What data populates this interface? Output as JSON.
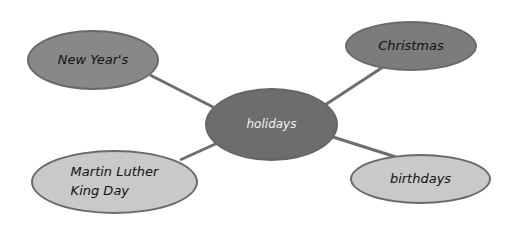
{
  "diagram": {
    "type": "mind-map",
    "center": {
      "label": "holidays",
      "color": "#6d6d6d"
    },
    "branches": [
      {
        "id": "new-years",
        "label": "New Year's",
        "color": "#888888"
      },
      {
        "id": "christmas",
        "label": "Christmas",
        "color": "#7c7c7c"
      },
      {
        "id": "mlk-day",
        "label_line1": "Martin Luther",
        "label_line2": "King Day",
        "color": "#c9c9c9"
      },
      {
        "id": "birthdays",
        "label": "birthdays",
        "color": "#c9c9c9"
      }
    ],
    "connector_color": "#6e6e6e"
  }
}
